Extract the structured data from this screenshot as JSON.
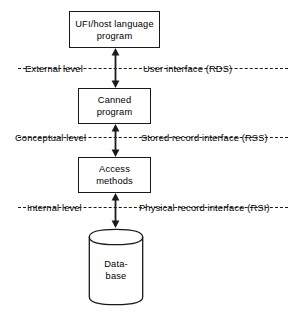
{
  "diagram": {
    "type": "layered-block-diagram",
    "stroke_color": "#1a1a1a",
    "background_color": "#ffffff"
  },
  "nodes": [
    {
      "id": "ufi-host-language-program",
      "shape": "rectangle",
      "lines": [
        "UFI/host language",
        "program"
      ]
    },
    {
      "id": "canned-program",
      "shape": "rectangle",
      "lines": [
        "Canned",
        "program"
      ]
    },
    {
      "id": "access-methods",
      "shape": "rectangle",
      "lines": [
        "Access",
        "methods"
      ]
    },
    {
      "id": "database",
      "shape": "cylinder",
      "lines": [
        "Data-",
        "base"
      ]
    }
  ],
  "levels": [
    {
      "id": "external",
      "left_label": "External level",
      "right_label": "User interface (RDS)"
    },
    {
      "id": "conceptual",
      "left_label": "Conceptual level",
      "right_label": "Stored record interface (RSS)"
    },
    {
      "id": "internal",
      "left_label": "Internal level",
      "right_label": "Physical record interface (RSI)"
    }
  ],
  "connectors": [
    {
      "id": "connector-ufi-canned",
      "style": "double-headed-arrow"
    },
    {
      "id": "connector-canned-access",
      "style": "double-headed-arrow"
    },
    {
      "id": "connector-access-database",
      "style": "double-headed-arrow"
    }
  ]
}
